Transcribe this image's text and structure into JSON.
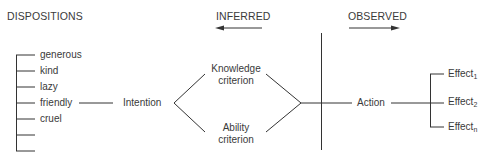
{
  "headers": {
    "dispositions": "DISPOSITIONS",
    "inferred": "INFERRED",
    "observed": "OBSERVED"
  },
  "dispositions": [
    "generous",
    "kind",
    "lazy",
    "friendly",
    "cruel",
    "",
    ""
  ],
  "nodes": {
    "intention": "Intention",
    "knowledge_line1": "Knowledge",
    "knowledge_line2": "criterion",
    "ability_line1": "Ability",
    "ability_line2": "criterion",
    "action": "Action"
  },
  "effects": [
    {
      "base": "Effect",
      "sub": "1"
    },
    {
      "base": "Effect",
      "sub": "2"
    },
    {
      "base": "Effect",
      "sub": "n"
    }
  ],
  "colors": {
    "line": "#333333",
    "text": "#3a3a3a"
  }
}
